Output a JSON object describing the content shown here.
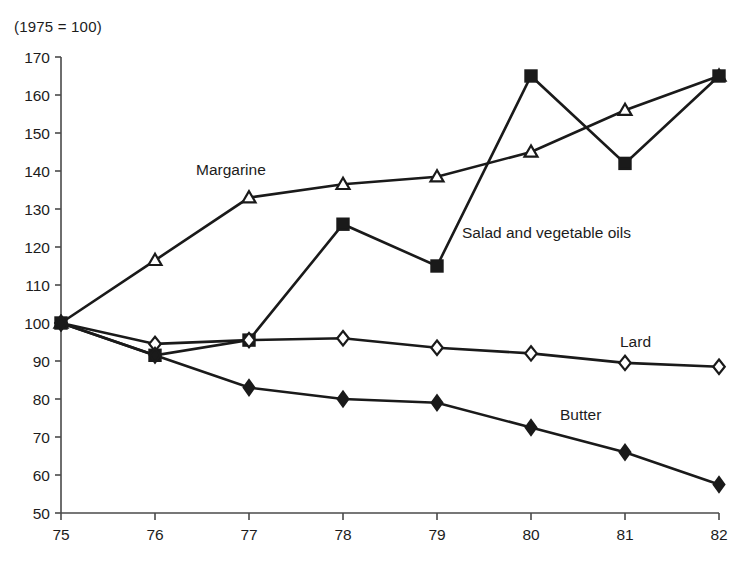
{
  "chart_data": {
    "type": "line",
    "title": "(1975 = 100)",
    "xlabel": "",
    "ylabel": "",
    "x": [
      "75",
      "76",
      "77",
      "78",
      "79",
      "80",
      "81",
      "82"
    ],
    "categories": [
      "75",
      "76",
      "77",
      "78",
      "79",
      "80",
      "81",
      "82"
    ],
    "xlim": [
      75,
      82
    ],
    "ylim": [
      50,
      170
    ],
    "yticks": [
      50,
      60,
      70,
      80,
      90,
      100,
      110,
      120,
      130,
      140,
      150,
      160,
      170
    ],
    "xticks": [
      "75",
      "76",
      "77",
      "78",
      "79",
      "80",
      "81",
      "82"
    ],
    "grid": false,
    "legend_position": "inline-annotations",
    "series": [
      {
        "name": "Margarine",
        "marker": "open-triangle",
        "label_x": "77",
        "values": [
          100,
          116.5,
          133,
          136.5,
          138.5,
          145,
          156,
          165
        ]
      },
      {
        "name": "Salad and vegetable oils",
        "marker": "filled-square",
        "label_x": "79",
        "values": [
          100,
          91.5,
          95.5,
          126,
          115,
          165,
          142,
          165
        ]
      },
      {
        "name": "Lard",
        "marker": "open-diamond",
        "label_x": "81",
        "values": [
          100,
          94.5,
          95.5,
          96,
          93.5,
          92,
          89.5,
          88.5
        ]
      },
      {
        "name": "Butter",
        "marker": "filled-diamond",
        "label_x": "80",
        "values": [
          100,
          91.5,
          83,
          80,
          79,
          72.5,
          66,
          57.5
        ]
      }
    ],
    "annotations": [
      {
        "text": "Margarine",
        "x": 196,
        "y": 175
      },
      {
        "text": "Salad and vegetable oils",
        "x": 462,
        "y": 238
      },
      {
        "text": "Lard",
        "x": 620,
        "y": 347
      },
      {
        "text": "Butter",
        "x": 560,
        "y": 420
      }
    ],
    "colors": {
      "line": "#1a1a1a",
      "marker_fill_open": "#ffffff",
      "marker_fill_solid": "#1a1a1a",
      "axis": "#4a4a4a",
      "text": "#1c1c1c",
      "background": "#ffffff"
    }
  }
}
